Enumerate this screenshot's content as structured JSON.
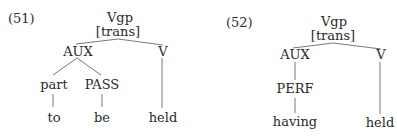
{
  "examples": [
    {
      "number": "(51)",
      "tree": {
        "root": "Vgp",
        "root_feature": "[trans]",
        "aux": "AUX",
        "v": "V",
        "aux_children": [
          {
            "category": "part",
            "word": "to"
          },
          {
            "category": "PASS",
            "word": "be"
          }
        ],
        "v_word": "held"
      }
    },
    {
      "number": "(52)",
      "tree": {
        "root": "Vgp",
        "root_feature": "[trans]",
        "aux": "AUX",
        "v": "V",
        "aux_children": [
          {
            "category": "PERF",
            "word": "having"
          }
        ],
        "v_word": "held"
      }
    }
  ]
}
